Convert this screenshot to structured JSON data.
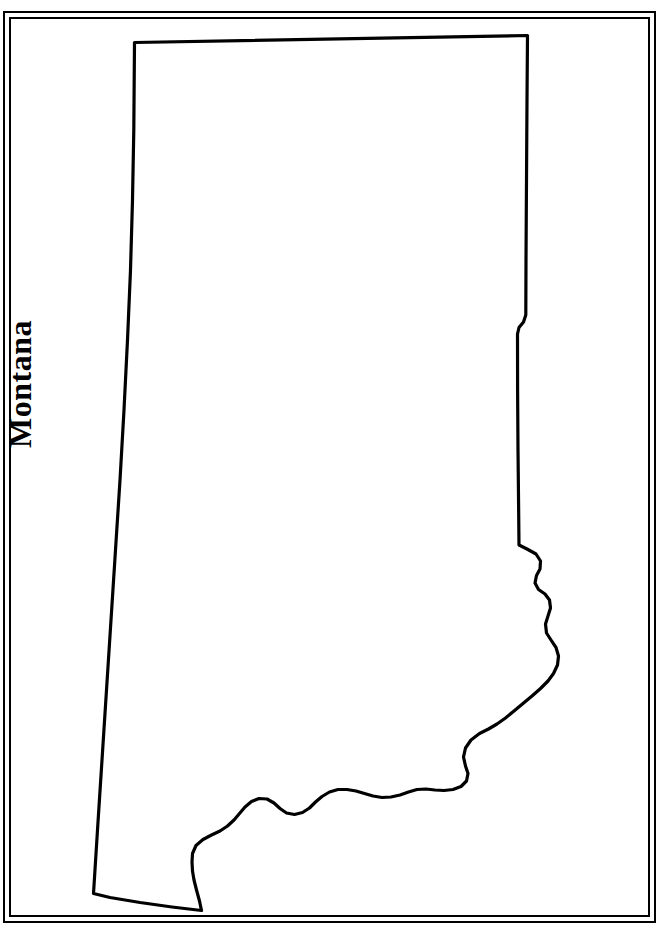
{
  "page": {
    "background_color": "#ffffff",
    "width": 663,
    "height": 936
  },
  "frame": {
    "style": "double-rule",
    "line_color": "#000000",
    "outer_line_width": 2,
    "inner_line_width": 2
  },
  "map": {
    "title": "Montana",
    "title_orientation": "vertical-bottom-to-top",
    "title_color": "#000000",
    "subject": "Montana",
    "region_type": "U.S. state",
    "fill_color": "#ffffff",
    "outline_color": "#000000",
    "outline_width": 3.2,
    "labels": [],
    "legend": [],
    "features": [
      {
        "name": "montana-state-boundary",
        "kind": "state-outline",
        "description": "Outline of the state of Montana: straight northern border along the 49th parallel, straight western/Idaho-panhandle-facing left border angling down-left, stepped eastern border, and an irregular wavy southern border."
      }
    ]
  }
}
